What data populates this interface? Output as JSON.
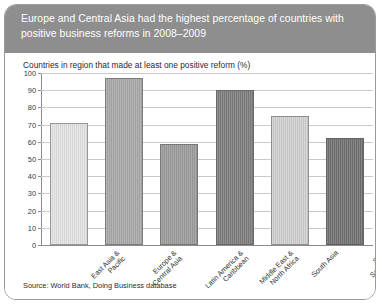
{
  "figure": {
    "title": "Europe and Central Asia had the highest percentage of countries with positive business reforms in 2008–2009",
    "subtitle": "Countries in region that made at least one positive reform (%)",
    "source": "Source: World Bank, Doing Business database",
    "title_background": "#8e8e8e",
    "title_color": "#ffffff",
    "border_color": "#9a9a9a"
  },
  "chart_data": {
    "type": "bar",
    "title": "Europe and Central Asia had the highest percentage of countries with positive business reforms in 2008–2009",
    "subtitle": "Countries in region that made at least one positive reform (%)",
    "xlabel": "",
    "ylabel": "Countries in region that made at least one positive reform (%)",
    "ylim": [
      0,
      100
    ],
    "ytick_step": 10,
    "yticks": [
      0,
      10,
      20,
      30,
      40,
      50,
      60,
      70,
      80,
      90,
      100
    ],
    "ytick_labels": [
      "0",
      "10",
      "20",
      "30",
      "40",
      "50",
      "60",
      "70",
      "80",
      "90",
      "100"
    ],
    "grid": true,
    "legend": false,
    "categories": [
      "East Asia &\nPacific",
      "Europe &\nCentral Asia",
      "Latin America &\nCaribbean",
      "Middle East &\nNorth Africa",
      "South Asia",
      "Sub-Saharan\nAfrica"
    ],
    "values": [
      71,
      97,
      59,
      90,
      75,
      62
    ],
    "colors": [
      "#e2e2e2",
      "#a8a8a8",
      "#9b9b9b",
      "#7c7c7c",
      "#cfcfcf",
      "#707070"
    ]
  }
}
